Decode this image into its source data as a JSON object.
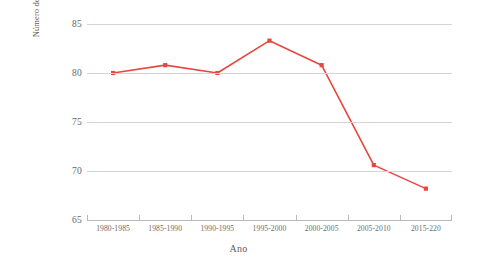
{
  "chart_data": {
    "type": "line",
    "title": "",
    "xlabel": "Ano",
    "ylabel": "Número de nascimentos a cada mil adolescentes entre 15 e 19 anos",
    "categories": [
      "1980-1985",
      "1985-1990",
      "1990-1995",
      "1995-2000",
      "2000-2005",
      "2005-2010",
      "2015-220"
    ],
    "series": [
      {
        "name": "Taxa de natalidade adolescente",
        "values": [
          80.0,
          80.8,
          80.0,
          83.3,
          80.8,
          70.6,
          68.2
        ],
        "color": "#E8473F"
      }
    ],
    "ylim": [
      65,
      85
    ],
    "yticks": [
      65,
      70,
      75,
      80,
      85
    ],
    "ytick_labels": [
      "65",
      "70",
      "75",
      "80",
      "85"
    ],
    "grid": true,
    "legend": "none",
    "marker": "square",
    "background": "#ffffff",
    "gridline_color": "#d4d4d4",
    "axis_color": "#b9b9b9",
    "text_color": "#5c5c5c"
  },
  "axis": {
    "y_title_line1": "Número de nascimentos a cada mil",
    "y_title_line2": "adolescentes entre 15 e 19 anos",
    "x_title": "Ano"
  }
}
